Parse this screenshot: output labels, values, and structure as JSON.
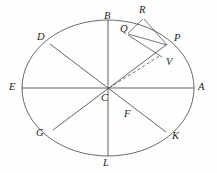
{
  "figure": {
    "type": "geometric-diagram",
    "background_color": "#fefefe",
    "line_color": "#5a5a5a",
    "label_color": "#1d1d1d"
  },
  "ellipse": {
    "center": {
      "x": 108,
      "y": 88
    },
    "radius_x": 86,
    "radius_y": 68,
    "stroke": "#5a5a5a"
  },
  "labels": {
    "A": "A",
    "B": "B",
    "C": "C",
    "D": "D",
    "E": "E",
    "F": "F",
    "G": "G",
    "K": "K",
    "L": "L",
    "P": "P",
    "Q": "Q",
    "R": "R",
    "V": "V"
  },
  "points": [
    {
      "id": "A",
      "label": "A",
      "x": 194,
      "y": 88,
      "label_x": 198,
      "label_y": 82
    },
    {
      "id": "B",
      "label": "B",
      "x": 108,
      "y": 20,
      "label_x": 104,
      "label_y": 11
    },
    {
      "id": "C",
      "label": "C",
      "x": 108,
      "y": 88,
      "label_x": 103,
      "label_y": 93
    },
    {
      "id": "D",
      "label": "D",
      "x": 50,
      "y": 44,
      "label_x": 38,
      "label_y": 33
    },
    {
      "id": "E",
      "label": "E",
      "x": 22,
      "y": 88,
      "label_x": 9,
      "label_y": 82
    },
    {
      "id": "F",
      "label": "F",
      "x": 131,
      "y": 105,
      "label_x": 125,
      "label_y": 110
    },
    {
      "id": "G",
      "label": "G",
      "x": 53,
      "y": 130,
      "label_x": 38,
      "label_y": 130
    },
    {
      "id": "K",
      "label": "K",
      "x": 166,
      "y": 132,
      "label_x": 172,
      "label_y": 132
    },
    {
      "id": "L",
      "label": "L",
      "x": 108,
      "y": 156,
      "label_x": 104,
      "label_y": 159
    },
    {
      "id": "P",
      "label": "P",
      "x": 166,
      "y": 45,
      "label_x": 173,
      "label_y": 34
    },
    {
      "id": "Q",
      "label": "Q",
      "x": 127,
      "y": 32,
      "label_x": 121,
      "label_y": 25
    },
    {
      "id": "R",
      "label": "R",
      "x": 143,
      "y": 18,
      "label_x": 140,
      "label_y": 6
    },
    {
      "id": "V",
      "label": "V",
      "x": 159,
      "y": 58,
      "label_x": 166,
      "label_y": 58
    }
  ],
  "diameters": [
    {
      "id": "A-E",
      "from": "E",
      "to": "A",
      "description": "horizontal major diameter"
    },
    {
      "id": "B-L",
      "from": "B",
      "to": "L",
      "description": "vertical minor diameter"
    },
    {
      "id": "D-K",
      "from": "D",
      "to": "K",
      "description": "oblique diameter descending to right"
    },
    {
      "id": "G-P",
      "from": "G",
      "to": "P",
      "description": "oblique diameter ascending to right"
    }
  ],
  "segments": [
    {
      "id": "R-P",
      "from": "R",
      "to": "P",
      "style": "solid"
    },
    {
      "id": "R-Q",
      "from": "R",
      "to": "Q",
      "style": "solid"
    },
    {
      "id": "Q-P",
      "from": "Q",
      "to": "P",
      "style": "solid"
    },
    {
      "id": "Q-V",
      "from": "Q",
      "to": "V",
      "style": "solid"
    },
    {
      "id": "C-V",
      "from": "C",
      "to": "V",
      "style": "dashed"
    }
  ]
}
